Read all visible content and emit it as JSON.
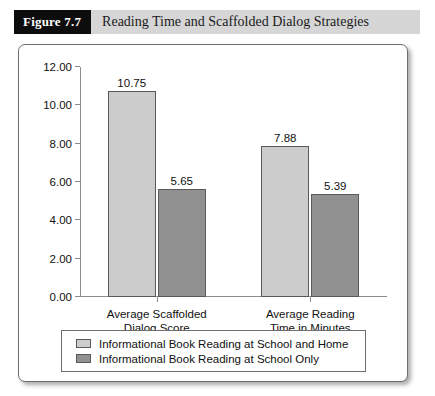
{
  "figure": {
    "number_label": "Figure 7.7",
    "title": "Reading Time and Scaffolded Dialog Strategies"
  },
  "chart_data": {
    "type": "bar",
    "title": "Reading Time and Scaffolded Dialog Strategies",
    "xlabel": "",
    "ylabel": "",
    "ylim": [
      0,
      12
    ],
    "ytick_labels": [
      "0.00",
      "2.00",
      "4.00",
      "6.00",
      "8.00",
      "10.00",
      "12.00"
    ],
    "ytick_values": [
      0,
      2,
      4,
      6,
      8,
      10,
      12
    ],
    "grid": false,
    "legend_position": "bottom",
    "categories": [
      [
        "Average Scaffolded",
        "Dialog Score"
      ],
      [
        "Average Reading",
        "Time in Minutes"
      ]
    ],
    "series": [
      {
        "name": "Informational Book Reading at School and Home",
        "color": "#cccccc",
        "values": [
          10.75,
          7.88
        ],
        "labels": [
          "10.75",
          "7.88"
        ]
      },
      {
        "name": "Informational Book Reading at School Only",
        "color": "#919191",
        "values": [
          5.65,
          5.39
        ],
        "labels": [
          "5.65",
          "5.39"
        ]
      }
    ]
  }
}
